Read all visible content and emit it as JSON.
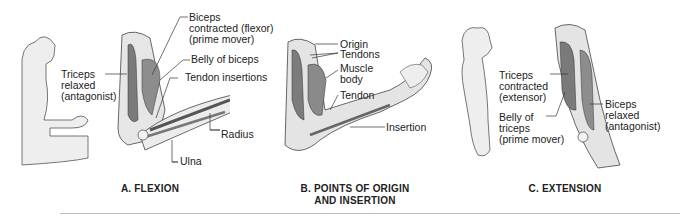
{
  "figure": {
    "colors": {
      "skin": "#e9e9e9",
      "muscle": "#8a8a8a",
      "bone": "#f2f2f2",
      "outline": "#333333",
      "text": "#222222"
    },
    "panels": [
      {
        "id": "A",
        "caption": "A. FLEXION",
        "labels": {
          "biceps": [
            "Biceps",
            "contracted (flexor)",
            "(prime mover)"
          ],
          "belly": "Belly of biceps",
          "tendon_insertions": "Tendon insertions",
          "triceps": [
            "Triceps",
            "relaxed",
            "(antagonist)"
          ],
          "radius": "Radius",
          "ulna": "Ulna"
        }
      },
      {
        "id": "B",
        "caption": [
          "B. POINTS OF ORIGIN",
          "AND INSERTION"
        ],
        "labels": {
          "origin": "Origin",
          "tendons": "Tendons",
          "muscle_body": [
            "Muscle",
            "body"
          ],
          "tendon": "Tendon",
          "insertion": "Insertion"
        }
      },
      {
        "id": "C",
        "caption": "C. EXTENSION",
        "labels": {
          "triceps": [
            "Triceps",
            "contracted",
            "(extensor)"
          ],
          "belly": [
            "Belly of",
            "triceps",
            "(prime mover)"
          ],
          "biceps": [
            "Biceps",
            "relaxed",
            "(antagonist)"
          ]
        }
      }
    ]
  }
}
